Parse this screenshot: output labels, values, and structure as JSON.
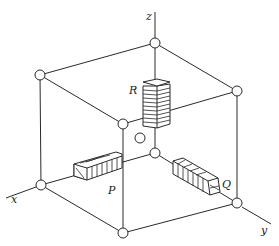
{
  "figure": {
    "type": "crystal-lattice-cube",
    "axes": {
      "x_label": "x",
      "y_label": "y",
      "z_label": "z"
    },
    "bars": {
      "p_label": "P",
      "q_label": "Q",
      "r_label": "R"
    },
    "colors": {
      "line": "#2a2a2a",
      "background": "#ffffff"
    }
  }
}
